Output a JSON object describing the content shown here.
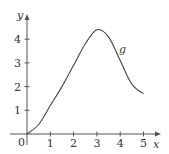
{
  "chart_data": {
    "type": "line",
    "title": "",
    "xlabel": "x",
    "ylabel": "y",
    "origin_label": "0",
    "curve_label": "g",
    "xlim": [
      0,
      5.4
    ],
    "ylim": [
      0,
      4.8
    ],
    "grid": false,
    "x_ticks": [
      "1",
      "2",
      "3",
      "4",
      "5"
    ],
    "y_ticks": [
      "1",
      "2",
      "3",
      "4"
    ],
    "series": [
      {
        "name": "g",
        "x": [
          0,
          0.5,
          1,
          1.5,
          2,
          2.5,
          3,
          3.5,
          4,
          4.5,
          5
        ],
        "values": [
          0,
          0.4,
          1.2,
          2.0,
          2.9,
          3.8,
          4.4,
          4.1,
          3.1,
          2.1,
          1.7
        ]
      }
    ],
    "colors": {
      "axis": "#555555",
      "curve": "#444444",
      "text": "#333333"
    }
  }
}
